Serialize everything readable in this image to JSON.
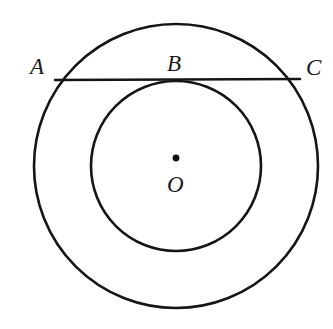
{
  "figure": {
    "kind": "concentric-circles-with-tangent-chord",
    "background_color": "#ffffff",
    "stroke_color": "#151515",
    "width": 333,
    "height": 329,
    "center": {
      "x": 176,
      "y": 166
    },
    "outer_circle": {
      "cx": 176,
      "cy": 166,
      "r": 142,
      "stroke_width": 2.6
    },
    "inner_circle": {
      "cx": 176,
      "cy": 166,
      "r": 85,
      "stroke_width": 2.6
    },
    "chord": {
      "name": "AC",
      "x1": 55,
      "y1": 80,
      "x2": 300,
      "y2": 79,
      "stroke_width": 2.6
    },
    "center_dot": {
      "cx": 176,
      "cy": 158,
      "r": 3.4
    }
  },
  "labels": {
    "a": "A",
    "b": "B",
    "c": "C",
    "o": "O"
  }
}
